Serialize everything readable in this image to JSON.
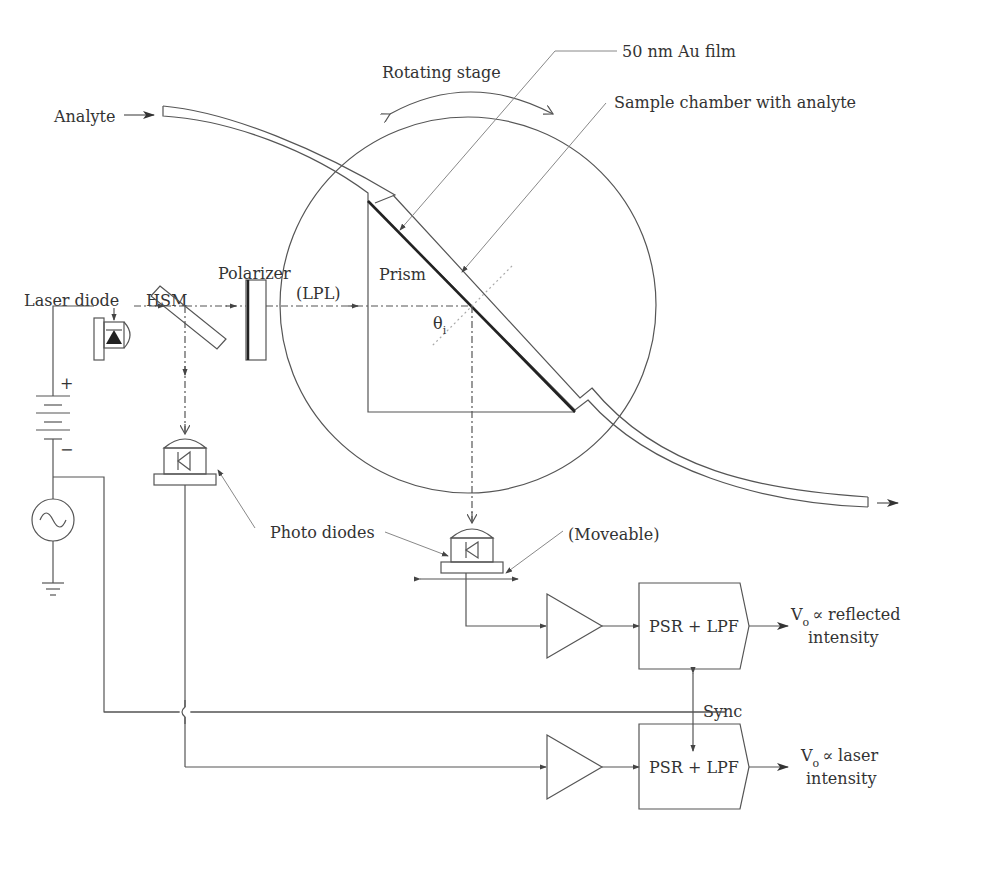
{
  "diagram": {
    "labels": {
      "analyte": "Analyte",
      "rotating_stage": "Rotating stage",
      "au_film": "50 nm Au film",
      "sample_chamber": "Sample chamber with analyte",
      "laser_diode": "Laser diode",
      "hsm": "HSM",
      "polarizer": "Polarizer",
      "lpl": "(LPL)",
      "prism": "Prism",
      "theta": "θ",
      "theta_sub": "i",
      "photo_diodes": "Photo diodes",
      "moveable": "(Moveable)",
      "sync": "Sync",
      "battery_plus": "+",
      "battery_minus": "−"
    },
    "blocks": [
      {
        "id": "psr-lpf-reflected",
        "label": "PSR + LPF",
        "output_v": "V",
        "output_sub": "o",
        "output_line1": "∝ reflected",
        "output_line2": "intensity"
      },
      {
        "id": "psr-lpf-laser",
        "label": "PSR + LPF",
        "output_v": "V",
        "output_sub": "o",
        "output_line1": "∝ laser",
        "output_line2": "intensity"
      }
    ],
    "colors": {
      "line": "#555555",
      "text": "#333333",
      "background": "#ffffff"
    }
  }
}
